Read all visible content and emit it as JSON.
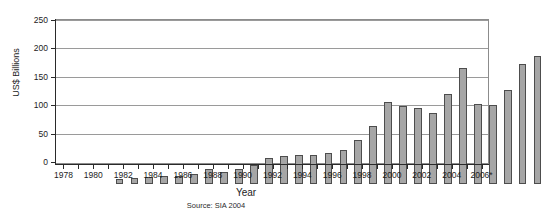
{
  "chart_data": {
    "type": "bar",
    "title": "",
    "xlabel": "Year",
    "ylabel": "US$ Billions",
    "source": "Source: SIA 2004",
    "ylim": [
      0,
      250
    ],
    "yticks": [
      0,
      50,
      100,
      150,
      200,
      250
    ],
    "grid": true,
    "legend": "none",
    "categories": [
      "1978",
      "1979",
      "1980",
      "1981",
      "1982",
      "1983",
      "1984",
      "1985",
      "1986",
      "1987",
      "1988",
      "1989",
      "1990",
      "1991",
      "1992",
      "1993",
      "1994",
      "1995",
      "1996",
      "1997",
      "1998",
      "1999",
      "2000",
      "2001",
      "2002",
      "2003",
      "2004",
      "2005",
      "2006*"
    ],
    "xtick_labels": [
      "1978",
      "1980",
      "1982",
      "1984",
      "1986",
      "1988",
      "1990",
      "1992",
      "1994",
      "1996",
      "1998",
      "2000",
      "2002",
      "2004",
      "2006*"
    ],
    "values": [
      8,
      10,
      13,
      14,
      14,
      17,
      26,
      22,
      26,
      33,
      45,
      50,
      51,
      51,
      55,
      60,
      77,
      102,
      144,
      137,
      134,
      125,
      159,
      204,
      141,
      139,
      166,
      211,
      226
    ],
    "bar_color": "#a6a6a6",
    "bar_edge_color": "#4d4d4d",
    "grid_color": "#9a9a9a",
    "axis_color": "#2a2a2a",
    "background": "#ffffff"
  }
}
